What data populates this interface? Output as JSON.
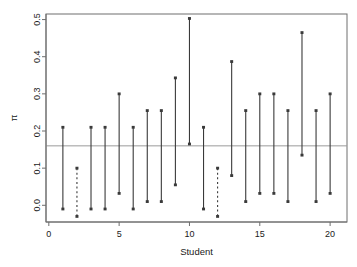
{
  "chart_data": {
    "type": "scatter",
    "title": "",
    "subtitle": "",
    "xlabel": "Student",
    "ylabel": "π",
    "xlim": [
      -0.2,
      21.2
    ],
    "ylim": [
      -0.045,
      0.515
    ],
    "xticks": [
      0,
      5,
      10,
      15,
      20
    ],
    "xticklabels": [
      "0",
      "5",
      "10",
      "15",
      "20"
    ],
    "yticks": [
      0.0,
      0.1,
      0.2,
      0.3,
      0.4,
      0.5
    ],
    "yticklabels": [
      "0.0",
      "0.1",
      "0.2",
      "0.3",
      "0.4",
      "0.5"
    ],
    "grid": false,
    "legend": null,
    "reference_line": {
      "orientation": "horizontal",
      "value": 0.16,
      "color": "#9a9a9a",
      "style": "solid"
    },
    "series_description": "Vertical confidence interval segments per student, drawn with solid lines except students 2 and 12 which are dashed.",
    "categories": [
      1,
      2,
      3,
      4,
      5,
      6,
      7,
      8,
      9,
      10,
      11,
      12,
      13,
      14,
      15,
      16,
      17,
      18,
      19,
      20
    ],
    "interval_color": "#3a3a3a",
    "intervals": [
      {
        "student": 1,
        "lower": -0.01,
        "upper": 0.21,
        "style": "solid"
      },
      {
        "student": 2,
        "lower": -0.03,
        "upper": 0.1,
        "style": "dashed"
      },
      {
        "student": 3,
        "lower": -0.01,
        "upper": 0.21,
        "style": "solid"
      },
      {
        "student": 4,
        "lower": -0.01,
        "upper": 0.21,
        "style": "solid"
      },
      {
        "student": 5,
        "lower": 0.032,
        "upper": 0.3,
        "style": "solid"
      },
      {
        "student": 6,
        "lower": -0.01,
        "upper": 0.21,
        "style": "solid"
      },
      {
        "student": 7,
        "lower": 0.01,
        "upper": 0.255,
        "style": "solid"
      },
      {
        "student": 8,
        "lower": 0.01,
        "upper": 0.255,
        "style": "solid"
      },
      {
        "student": 9,
        "lower": 0.055,
        "upper": 0.343,
        "style": "solid"
      },
      {
        "student": 10,
        "lower": 0.165,
        "upper": 0.503,
        "style": "solid"
      },
      {
        "student": 11,
        "lower": -0.01,
        "upper": 0.21,
        "style": "solid"
      },
      {
        "student": 12,
        "lower": -0.03,
        "upper": 0.1,
        "style": "dashed"
      },
      {
        "student": 13,
        "lower": 0.08,
        "upper": 0.387,
        "style": "solid"
      },
      {
        "student": 14,
        "lower": 0.01,
        "upper": 0.255,
        "style": "solid"
      },
      {
        "student": 15,
        "lower": 0.032,
        "upper": 0.3,
        "style": "solid"
      },
      {
        "student": 16,
        "lower": 0.032,
        "upper": 0.3,
        "style": "solid"
      },
      {
        "student": 17,
        "lower": 0.01,
        "upper": 0.255,
        "style": "solid"
      },
      {
        "student": 18,
        "lower": 0.135,
        "upper": 0.465,
        "style": "solid"
      },
      {
        "student": 19,
        "lower": 0.01,
        "upper": 0.255,
        "style": "solid"
      },
      {
        "student": 20,
        "lower": 0.032,
        "upper": 0.3,
        "style": "solid"
      }
    ]
  },
  "axes": {
    "x_title": "Student",
    "y_title": "π",
    "x_tick_labels": [
      "0",
      "5",
      "10",
      "15",
      "20"
    ],
    "y_tick_labels": [
      "0.0",
      "0.1",
      "0.2",
      "0.3",
      "0.4",
      "0.5"
    ]
  },
  "colors": {
    "frame": "#6e6e6e",
    "interval": "#3a3a3a",
    "reference": "#9a9a9a",
    "text": "#1a1a1a",
    "background": "#ffffff"
  }
}
